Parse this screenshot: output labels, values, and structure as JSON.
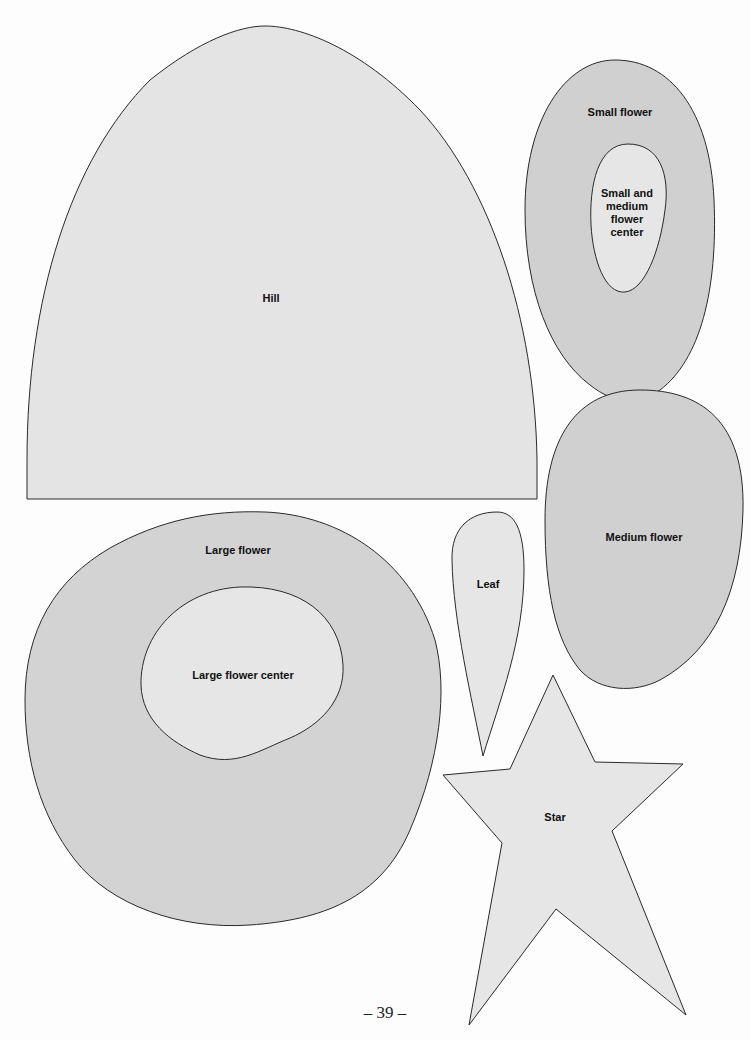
{
  "page": {
    "number": "39",
    "page_number_display": "– 39 –",
    "colors": {
      "dark_fill": "#d2d2d2",
      "light_fill": "#e6e6e6",
      "outline": "#2a2a2a",
      "background": "#fdfdfd"
    }
  },
  "templates": [
    {
      "id": "hill",
      "label": "Hill",
      "fill": "light"
    },
    {
      "id": "small-flower",
      "label": "Small flower",
      "fill": "dark"
    },
    {
      "id": "small-medium-flower-center",
      "label": "Small and medium flower center",
      "lines": [
        "Small and",
        "medium",
        "flower",
        "center"
      ],
      "fill": "light"
    },
    {
      "id": "medium-flower",
      "label": "Medium flower",
      "fill": "dark"
    },
    {
      "id": "leaf",
      "label": "Leaf",
      "fill": "light"
    },
    {
      "id": "large-flower",
      "label": "Large flower",
      "fill": "dark"
    },
    {
      "id": "large-flower-center",
      "label": "Large flower center",
      "fill": "light"
    },
    {
      "id": "star",
      "label": "Star",
      "fill": "light"
    }
  ]
}
